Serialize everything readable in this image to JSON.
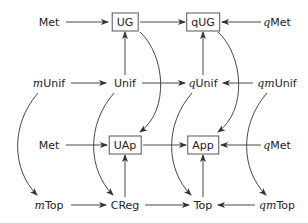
{
  "diagram": {
    "nodes": [
      {
        "id": "met1",
        "prefix": "",
        "label": "Met",
        "boxed": false,
        "x": 49,
        "y": 22
      },
      {
        "id": "ug",
        "prefix": "",
        "label": "UG",
        "boxed": true,
        "x": 125,
        "y": 22
      },
      {
        "id": "qug",
        "prefix": "",
        "label": "qUG",
        "boxed": true,
        "x": 203,
        "y": 22
      },
      {
        "id": "qmet1",
        "prefix": "q",
        "label": "Met",
        "boxed": false,
        "x": 277,
        "y": 22
      },
      {
        "id": "munif",
        "prefix": "m",
        "label": "Unif",
        "boxed": false,
        "x": 49,
        "y": 83
      },
      {
        "id": "unif",
        "prefix": "",
        "label": "Unif",
        "boxed": false,
        "x": 125,
        "y": 83
      },
      {
        "id": "qunif",
        "prefix": "q",
        "label": "Unif",
        "boxed": false,
        "x": 203,
        "y": 83
      },
      {
        "id": "qmunif",
        "prefix": "qm",
        "label": "Unif",
        "boxed": false,
        "x": 277,
        "y": 83
      },
      {
        "id": "met2",
        "prefix": "",
        "label": "Met",
        "boxed": false,
        "x": 49,
        "y": 145
      },
      {
        "id": "uap",
        "prefix": "",
        "label": "UAp",
        "boxed": true,
        "x": 125,
        "y": 145
      },
      {
        "id": "app",
        "prefix": "",
        "label": "App",
        "boxed": true,
        "x": 203,
        "y": 145
      },
      {
        "id": "qmet2",
        "prefix": "q",
        "label": "Met",
        "boxed": false,
        "x": 277,
        "y": 145
      },
      {
        "id": "mtop",
        "prefix": "m",
        "label": "Top",
        "boxed": false,
        "x": 49,
        "y": 205
      },
      {
        "id": "creg",
        "prefix": "",
        "label": "CReg",
        "boxed": false,
        "x": 125,
        "y": 205
      },
      {
        "id": "top",
        "prefix": "",
        "label": "Top",
        "boxed": false,
        "x": 203,
        "y": 205
      },
      {
        "id": "qmtop",
        "prefix": "qm",
        "label": "Top",
        "boxed": false,
        "x": 277,
        "y": 205
      }
    ],
    "edges": [
      {
        "from": "met1",
        "to": "ug",
        "type": "straight"
      },
      {
        "from": "qmet1",
        "to": "qug",
        "type": "straight"
      },
      {
        "from": "ug",
        "to": "qug",
        "type": "straight"
      },
      {
        "from": "unif",
        "to": "ug",
        "type": "straight"
      },
      {
        "from": "qunif",
        "to": "qug",
        "type": "straight"
      },
      {
        "from": "munif",
        "to": "unif",
        "type": "straight"
      },
      {
        "from": "unif",
        "to": "qunif",
        "type": "straight"
      },
      {
        "from": "qmunif",
        "to": "qunif",
        "type": "straight"
      },
      {
        "from": "met2",
        "to": "uap",
        "type": "straight"
      },
      {
        "from": "uap",
        "to": "app",
        "type": "straight"
      },
      {
        "from": "qmet2",
        "to": "app",
        "type": "straight"
      },
      {
        "from": "creg",
        "to": "uap",
        "type": "straight"
      },
      {
        "from": "top",
        "to": "app",
        "type": "straight"
      },
      {
        "from": "mtop",
        "to": "creg",
        "type": "straight"
      },
      {
        "from": "creg",
        "to": "top",
        "type": "straight"
      },
      {
        "from": "qmtop",
        "to": "top",
        "type": "straight"
      },
      {
        "from": "ug",
        "to": "uap",
        "type": "curved"
      },
      {
        "from": "qug",
        "to": "app",
        "type": "curved"
      },
      {
        "from": "munif",
        "to": "mtop",
        "type": "curved"
      },
      {
        "from": "unif",
        "to": "creg",
        "type": "curved"
      },
      {
        "from": "qunif",
        "to": "top",
        "type": "curved"
      },
      {
        "from": "qmunif",
        "to": "qmtop",
        "type": "curved"
      }
    ]
  }
}
